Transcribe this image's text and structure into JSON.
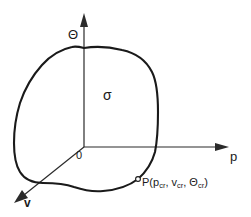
{
  "figure": {
    "kind": "thermodynamic-surface-sketch",
    "background_color": "#ffffff",
    "line_color": "#1a1a1a",
    "axes": {
      "vertical": {
        "label": "Θ",
        "name": "theta-axis",
        "direction": "up"
      },
      "horizontal": {
        "label": "p",
        "name": "p-axis",
        "direction": "right"
      },
      "oblique": {
        "label": "v",
        "name": "v-axis",
        "direction": "down-left"
      },
      "origin_label": "0"
    },
    "region_label": "σ",
    "point": {
      "name": "critical-point",
      "prefix": "P(p",
      "sub_1": "cr",
      "mid_1": ", v",
      "sub_2": "cr",
      "mid_2": ", Θ",
      "sub_3": "cr",
      "suffix": ")",
      "full_text": "P(p_cr, v_cr, Θ_cr)"
    }
  }
}
